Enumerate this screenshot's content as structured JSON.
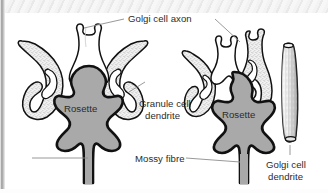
{
  "figure": {
    "kind": "anatomical-diagram",
    "background_color": "#ffffff",
    "ink_color": "#111111",
    "rosette_fill": "#a9a9a9",
    "stipple_fill": "#eeeeee",
    "axon_fill": "#ffffff",
    "leader_color": "#8d8d8d",
    "label_color": "#2b2b2b",
    "labels": {
      "golgi_cell_axon": "Golgi cell axon",
      "granule_cell_dendrite_line1": "Granule cell",
      "granule_cell_dendrite_line2": "dendrite",
      "mossy_fibre": "Mossy fibre",
      "golgi_cell_dendrite_line1": "Golgi cell",
      "golgi_cell_dendrite_line2": "dendrite",
      "rosette_left": "Rosette",
      "rosette_right": "Rosette"
    }
  }
}
